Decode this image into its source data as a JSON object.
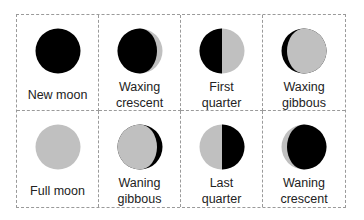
{
  "diagram": {
    "colors": {
      "dark": "#000000",
      "lit": "#c0c0c0",
      "border": "#9a9a9a",
      "text": "#222222"
    },
    "phases": [
      {
        "line1": "New moon",
        "line2": "",
        "icon": "new-moon-icon"
      },
      {
        "line1": "Waxing",
        "line2": "crescent",
        "icon": "waxing-crescent-icon"
      },
      {
        "line1": "First",
        "line2": "quarter",
        "icon": "first-quarter-icon"
      },
      {
        "line1": "Waxing",
        "line2": "gibbous",
        "icon": "waxing-gibbous-icon"
      },
      {
        "line1": "Full moon",
        "line2": "",
        "icon": "full-moon-icon"
      },
      {
        "line1": "Waning",
        "line2": "gibbous",
        "icon": "waning-gibbous-icon"
      },
      {
        "line1": "Last",
        "line2": "quarter",
        "icon": "last-quarter-icon"
      },
      {
        "line1": "Waning",
        "line2": "crescent",
        "icon": "waning-crescent-icon"
      }
    ]
  }
}
